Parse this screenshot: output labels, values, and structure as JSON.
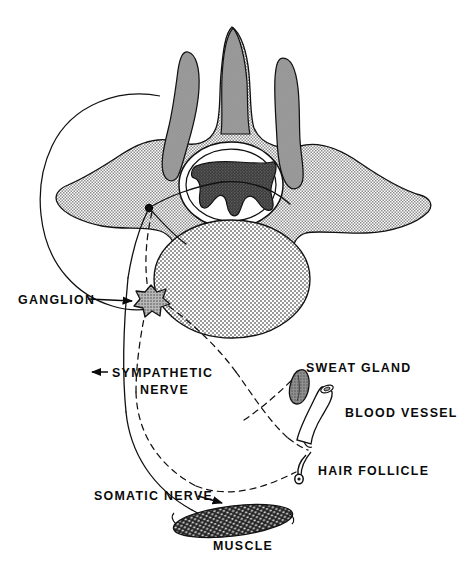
{
  "figure": {
    "background_color": "#ffffff",
    "ink_color": "#0a0a0a",
    "width": 465,
    "height": 576
  },
  "palette": {
    "bone_stipple": "#a8a8a8",
    "process_gray": "#9a9a9a",
    "body_stipple": "#b4b4b4",
    "gray_matter": "#4a4a4a",
    "ganglion_fill": "#9e9e9e",
    "muscle_fill": "#2b2b2b",
    "sweat_gland_fill": "#8a8a8a",
    "outline": "#111111",
    "white": "#ffffff"
  },
  "labels": [
    {
      "id": "ganglion",
      "text": "GANGLION",
      "x": 18,
      "y": 303,
      "lines": [
        "GANGLION"
      ]
    },
    {
      "id": "sympathetic",
      "text": "SYMPATHETIC NERVE",
      "x": 110,
      "y": 375,
      "lines": [
        "SYMPATHETIC",
        "NERVE"
      ]
    },
    {
      "id": "sweat-gland",
      "text": "SWEAT GLAND",
      "x": 306,
      "y": 367,
      "lines": [
        "SWEAT GLAND"
      ]
    },
    {
      "id": "blood-vessel",
      "text": "BLOOD VESSEL",
      "x": 345,
      "y": 412,
      "lines": [
        "BLOOD VESSEL"
      ]
    },
    {
      "id": "hair-follicle",
      "text": "HAIR FOLLICLE",
      "x": 317,
      "y": 470,
      "lines": [
        "HAIR FOLLICLE"
      ]
    },
    {
      "id": "somatic",
      "text": "SOMATIC NERVE",
      "x": 94,
      "y": 497,
      "lines": [
        "SOMATIC NERVE"
      ]
    },
    {
      "id": "muscle",
      "text": "MUSCLE",
      "x": 215,
      "y": 545,
      "lines": [
        "MUSCLE"
      ]
    }
  ],
  "label_text": {
    "ganglion": "GANGLION",
    "sympathetic_line1": "SYMPATHETIC",
    "sympathetic_line2": "NERVE",
    "sweat_gland": "SWEAT GLAND",
    "blood_vessel": "BLOOD VESSEL",
    "hair_follicle": "HAIR FOLLICLE",
    "somatic_nerve": "SOMATIC NERVE",
    "muscle": "MUSCLE"
  },
  "structures": [
    {
      "id": "vertebra",
      "name": "vertebra-body-and-arch",
      "fill": "stipple-bone"
    },
    {
      "id": "spinous-process",
      "name": "spinous-process",
      "fill": "process-gray"
    },
    {
      "id": "articular-left",
      "name": "superior-articular-process-left",
      "fill": "process-gray"
    },
    {
      "id": "articular-right",
      "name": "superior-articular-process-right",
      "fill": "process-gray"
    },
    {
      "id": "vertebral-body",
      "name": "vertebral-body-disc",
      "fill": "stipple-body"
    },
    {
      "id": "spinal-cord",
      "name": "spinal-cord-gray-matter",
      "fill": "dark-stipple"
    },
    {
      "id": "rib-outline",
      "name": "rib-outline-circle",
      "fill": "none"
    },
    {
      "id": "ganglion",
      "name": "sympathetic-ganglion",
      "fill": "stipple-ganglion"
    },
    {
      "id": "muscle",
      "name": "skeletal-muscle",
      "fill": "dark-textured"
    },
    {
      "id": "sweat-gland",
      "name": "sweat-gland",
      "fill": "mid-gray"
    },
    {
      "id": "blood-vessel",
      "name": "blood-vessel-tube",
      "fill": "white"
    },
    {
      "id": "hair-follicle",
      "name": "hair-follicle",
      "fill": "white"
    }
  ],
  "pathways": [
    {
      "id": "somatic-nerve",
      "style": "solid",
      "from": "spinal-cord",
      "to": "muscle"
    },
    {
      "id": "sympathetic-nerve",
      "style": "dashed",
      "from": "spinal-cord",
      "to": "ganglion"
    },
    {
      "id": "postganglionic-sweat",
      "style": "dashed",
      "from": "ganglion",
      "to": "sweat-gland"
    },
    {
      "id": "postganglionic-vessel",
      "style": "dashed",
      "from": "ganglion",
      "to": "blood-vessel"
    },
    {
      "id": "postganglionic-hair",
      "style": "dashed",
      "from": "ganglion",
      "to": "hair-follicle"
    }
  ]
}
